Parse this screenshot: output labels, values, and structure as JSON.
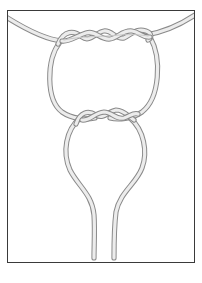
{
  "figure": {
    "type": "knot-illustration",
    "colors": {
      "border": "#3a3a3a",
      "cord_outline": "#8a8a8a",
      "cord_fill": "#ececec",
      "background": "#ffffff"
    },
    "elements": {
      "top_cord": "curved horizontal cord",
      "upper_wrap": "twisted wrap on top cord",
      "upper_loop": "circular loop",
      "lower_wrap": "twisted wrap joining loops",
      "lower_loop": "tapering loop with two hanging ends"
    }
  }
}
